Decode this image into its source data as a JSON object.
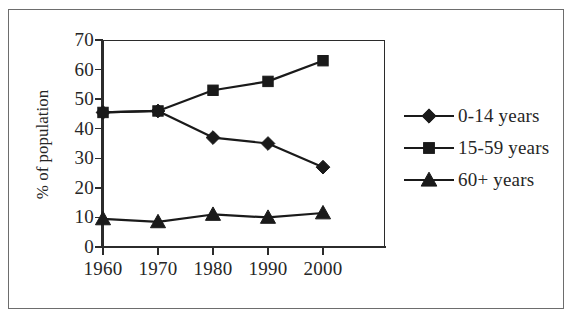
{
  "chart_data": {
    "type": "line",
    "title": "",
    "subtitle": "",
    "xlabel": "",
    "ylabel": "% of population",
    "categories": [
      "1960",
      "1970",
      "1980",
      "1990",
      "2000"
    ],
    "x": [
      1960,
      1970,
      1980,
      1990,
      2000
    ],
    "xlim": [
      1955,
      2005
    ],
    "ylim": [
      0,
      70
    ],
    "y_ticks": [
      "0",
      "10",
      "20",
      "30",
      "40",
      "50",
      "60",
      "70"
    ],
    "y_tick_values": [
      0,
      10,
      20,
      30,
      40,
      50,
      60,
      70
    ],
    "grid": false,
    "legend_position": "right",
    "series": [
      {
        "name": "0-14 years",
        "marker": "diamond",
        "color": "#1a1a1a",
        "values": [
          45.5,
          46,
          37,
          35,
          27
        ]
      },
      {
        "name": "15-59 years",
        "marker": "square",
        "color": "#1a1a1a",
        "values": [
          45.5,
          46,
          53,
          56,
          63
        ]
      },
      {
        "name": "60+ years",
        "marker": "triangle",
        "color": "#1a1a1a",
        "values": [
          9.5,
          8.5,
          11,
          10,
          11.5
        ]
      }
    ]
  },
  "legend": {
    "items": [
      {
        "label": "0-14 years",
        "marker": "diamond-marker-icon"
      },
      {
        "label": "15-59 years",
        "marker": "square-marker-icon"
      },
      {
        "label": "60+ years",
        "marker": "triangle-marker-icon"
      }
    ]
  },
  "colors": {
    "ink": "#1a1a1a",
    "axis": "#2b2b2b",
    "frame": "#6d6d6d",
    "background": "#ffffff"
  }
}
